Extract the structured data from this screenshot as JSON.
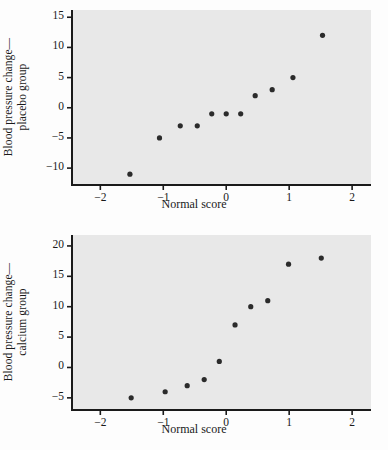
{
  "figure": {
    "width": 388,
    "height": 450,
    "background": "#fdfdfd",
    "panel_background": "#e8e8e8",
    "axis_color": "#1a1a1a",
    "point_color": "#2b2b2b"
  },
  "chart_data": [
    {
      "type": "scatter",
      "title": "",
      "xlabel": "Normal score",
      "ylabel": "Blood pressure change—\nplacebo group",
      "ylabel_line1": "Blood pressure change—",
      "ylabel_line2": "placebo group",
      "xlim": [
        -2.45,
        2.3
      ],
      "ylim": [
        -12.8,
        16.2
      ],
      "xticks": [
        -2,
        -1,
        0,
        1,
        2
      ],
      "xticklabels": [
        "−2",
        "−1",
        "0",
        "1",
        "2"
      ],
      "yticks": [
        -10,
        -5,
        0,
        5,
        10,
        15
      ],
      "yticklabels": [
        "−10",
        "−5",
        "0",
        "5",
        "10",
        "15"
      ],
      "grid": false,
      "legend": "none",
      "series": [
        {
          "name": "placebo group",
          "x": [
            -1.53,
            -1.06,
            -0.73,
            -0.46,
            -0.23,
            0.0,
            0.23,
            0.46,
            0.73,
            1.06,
            1.53
          ],
          "y": [
            -11,
            -5,
            -3,
            -3,
            -1,
            -1,
            -1,
            2,
            3,
            5,
            12
          ]
        }
      ]
    },
    {
      "type": "scatter",
      "title": "",
      "xlabel": "Normal score",
      "ylabel": "Blood pressure change—\ncalcium group",
      "ylabel_line1": "Blood pressure change—",
      "ylabel_line2": "calcium group",
      "xlim": [
        -2.45,
        2.3
      ],
      "ylim": [
        -7.0,
        21.8
      ],
      "xticks": [
        -2,
        -1,
        0,
        1,
        2
      ],
      "xticklabels": [
        "−2",
        "−1",
        "0",
        "1",
        "2"
      ],
      "yticks": [
        -5,
        0,
        5,
        10,
        15,
        20
      ],
      "yticklabels": [
        "−5",
        "0",
        "5",
        "10",
        "15",
        "20"
      ],
      "grid": false,
      "legend": "none",
      "series": [
        {
          "name": "calcium group",
          "x": [
            -1.51,
            -0.97,
            -0.62,
            -0.35,
            -0.11,
            0.14,
            0.39,
            0.66,
            0.99,
            1.51
          ],
          "y": [
            -5,
            -4,
            -3,
            -2,
            1,
            7,
            10,
            11,
            17,
            18
          ]
        }
      ]
    }
  ]
}
